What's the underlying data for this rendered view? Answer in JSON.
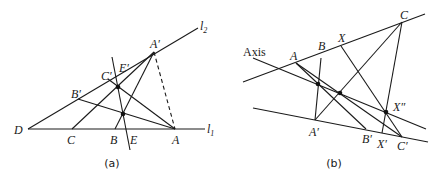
{
  "panels": [
    {
      "id": "a",
      "caption": "(a)",
      "labels": {
        "l1": "l",
        "l1_sub": "1",
        "l2": "l",
        "l2_sub": "2",
        "D": "D",
        "C": "C",
        "B": "B",
        "E": "E",
        "A": "A",
        "A_prime": "A′",
        "B_prime": "B′",
        "C_prime": "C′",
        "E_prime": "E′"
      }
    },
    {
      "id": "b",
      "caption": "(b)",
      "labels": {
        "axis": "Axis",
        "A": "A",
        "B": "B",
        "X": "X",
        "C": "C",
        "A_prime": "A′",
        "B_prime": "B′",
        "X_prime": "X′",
        "C_prime": "C′",
        "X_double_prime": "X″"
      }
    }
  ]
}
